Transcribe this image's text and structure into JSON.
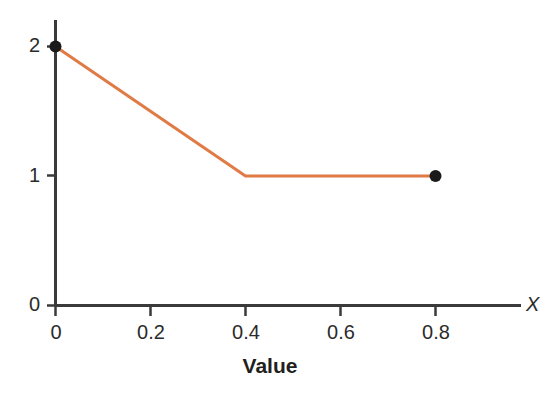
{
  "chart_data": {
    "type": "line",
    "title": "",
    "subtitle": "",
    "xlabel": "Value",
    "ylabel": "",
    "x_axis_name": "X",
    "xlim": [
      0,
      0.98
    ],
    "ylim": [
      0,
      2.2
    ],
    "xticks": [
      0,
      0.2,
      0.4,
      0.6,
      0.8
    ],
    "xtick_labels": [
      "0",
      "0.2",
      "0.4",
      "0.6",
      "0.8"
    ],
    "yticks": [
      0,
      1,
      2
    ],
    "ytick_labels": [
      "0",
      "1",
      "2"
    ],
    "grid": false,
    "legend": false,
    "legend_position": "none",
    "series": [
      {
        "name": "piecewise-linear",
        "color": "#E07B46",
        "line_width": 3,
        "x": [
          0,
          0.4,
          0.8
        ],
        "y": [
          2,
          1,
          1
        ]
      }
    ],
    "markers": [
      {
        "name": "start-point",
        "x": 0,
        "y": 2,
        "color": "#1a1a1a",
        "radius": 6
      },
      {
        "name": "end-point",
        "x": 0.8,
        "y": 1,
        "color": "#1a1a1a",
        "radius": 6
      }
    ],
    "annotations": [],
    "axis_color": "#3a3a3a",
    "background_color": "#ffffff"
  },
  "axes": {
    "x_title": "Value",
    "x_name": "X",
    "x_tick_labels": [
      "0",
      "0.2",
      "0.4",
      "0.6",
      "0.8"
    ],
    "y_tick_labels": [
      "2",
      "1",
      "0"
    ]
  }
}
